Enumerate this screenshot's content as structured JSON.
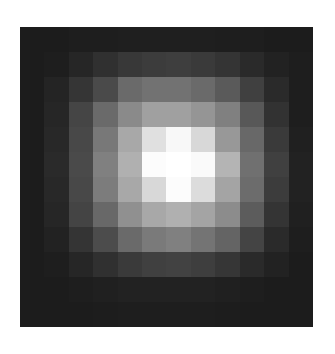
{
  "chart_data": {
    "type": "heatmap",
    "title": "",
    "xlabel": "",
    "ylabel": "",
    "colormap": "grayscale",
    "rows": 12,
    "cols": 12,
    "value_range": [
      0,
      255
    ],
    "grid": false,
    "legend": "none",
    "values": [
      [
        28,
        28,
        30,
        30,
        31,
        31,
        31,
        31,
        30,
        30,
        28,
        28
      ],
      [
        28,
        30,
        38,
        48,
        56,
        60,
        62,
        58,
        52,
        42,
        34,
        30
      ],
      [
        28,
        36,
        53,
        74,
        106,
        114,
        114,
        106,
        90,
        64,
        42,
        30
      ],
      [
        28,
        38,
        69,
        106,
        138,
        160,
        160,
        149,
        128,
        88,
        50,
        30
      ],
      [
        28,
        40,
        72,
        120,
        168,
        224,
        248,
        216,
        152,
        104,
        58,
        32
      ],
      [
        28,
        42,
        74,
        128,
        176,
        252,
        255,
        250,
        180,
        112,
        64,
        34
      ],
      [
        28,
        40,
        72,
        124,
        168,
        216,
        252,
        220,
        164,
        108,
        60,
        34
      ],
      [
        28,
        38,
        68,
        104,
        144,
        168,
        176,
        164,
        140,
        92,
        52,
        32
      ],
      [
        28,
        34,
        52,
        76,
        106,
        122,
        128,
        116,
        100,
        68,
        42,
        30
      ],
      [
        28,
        30,
        38,
        48,
        58,
        64,
        66,
        62,
        54,
        42,
        34,
        28
      ],
      [
        28,
        28,
        30,
        32,
        34,
        34,
        34,
        34,
        32,
        30,
        28,
        28
      ],
      [
        28,
        28,
        28,
        29,
        30,
        30,
        30,
        30,
        29,
        28,
        28,
        28
      ]
    ]
  },
  "background": "#ffffff"
}
